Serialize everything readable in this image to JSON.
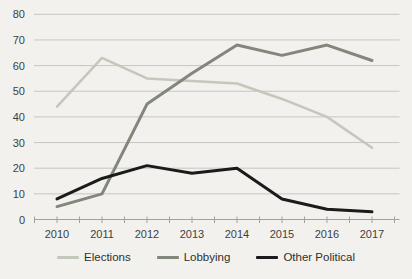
{
  "chart_data": {
    "type": "line",
    "title": "",
    "xlabel": "",
    "ylabel": "",
    "categories": [
      "2010",
      "2011",
      "2012",
      "2013",
      "2014",
      "2015",
      "2016",
      "2017"
    ],
    "series": [
      {
        "name": "Elections",
        "color": "#c4c8bb",
        "stroke_width": 2.5,
        "values": [
          44,
          63,
          55,
          54,
          53,
          47,
          40,
          28
        ]
      },
      {
        "name": "Lobbying",
        "color": "#83867b",
        "stroke_width": 3,
        "values": [
          5,
          10,
          45,
          57,
          68,
          64,
          68,
          62
        ]
      },
      {
        "name": "Other Political",
        "color": "#1b1b1b",
        "stroke_width": 3,
        "values": [
          8,
          16,
          21,
          18,
          20,
          8,
          4,
          3
        ]
      }
    ],
    "ylim": [
      0,
      80
    ],
    "ytick_step": 10,
    "ytick_labels": [
      "0",
      "10",
      "20",
      "30",
      "40",
      "50",
      "60",
      "70",
      "80"
    ],
    "grid": true,
    "legend_position": "bottom",
    "colors": {
      "background": "#f2f1ed",
      "gridline": "#c7c6c2",
      "axis": "#a3a29e",
      "tick": "#a3a29e",
      "label_text": "#3f3f3f"
    }
  }
}
